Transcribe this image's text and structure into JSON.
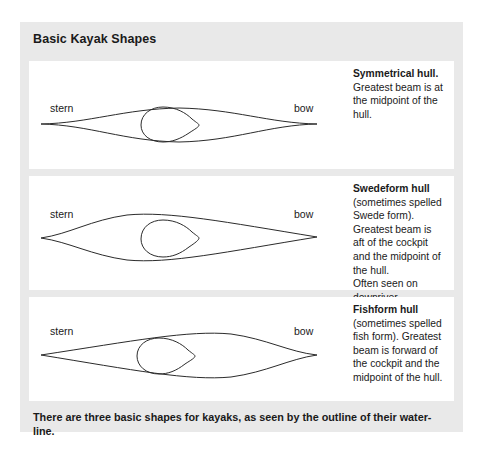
{
  "figure": {
    "title": "Basic Kayak Shapes",
    "caption": "There are three basic shapes for kayaks, as seen by the outline of their water-line.",
    "background_color": "#e9e9e9",
    "panel_color": "#ffffff",
    "line_color": "#2b2b2b"
  },
  "labels": {
    "stern": "stern",
    "bow": "bow"
  },
  "rows": [
    {
      "id": "symmetrical",
      "diagram_name": "symmetrical-hull-diagram",
      "stern": "stern",
      "bow": "bow",
      "heading": "Symmetrical hull.",
      "body": " Greatest beam is at the midpoint of the hull.",
      "body2": ""
    },
    {
      "id": "swedeform",
      "diagram_name": "swedeform-hull-diagram",
      "stern": "stern",
      "bow": "bow",
      "heading": "Swedeform hull",
      "body": " (sometimes spelled Swede form). Greatest beam is aft of the cockpit and the midpoint of the hull.",
      "body2": "Often seen on downriver (wildwater) racing kayaks."
    },
    {
      "id": "fishform",
      "diagram_name": "fishform-hull-diagram",
      "stern": "stern",
      "bow": "bow",
      "heading": "Fishform hull",
      "body": " (sometimes spelled fish form). Greatest beam is forward of the cockpit and the midpoint of the hull.",
      "body2": ""
    }
  ]
}
